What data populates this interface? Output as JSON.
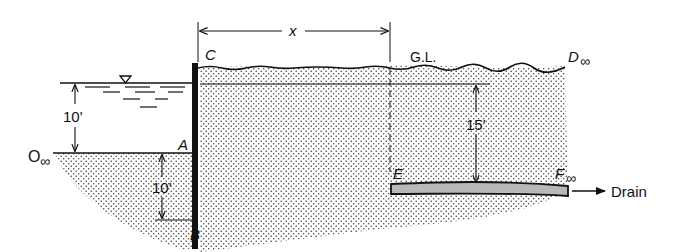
{
  "diagram": {
    "type": "sheet-pile seepage cross-section",
    "labels": {
      "point_C": "C",
      "point_A": "A",
      "point_B": "B",
      "point_D": "D",
      "point_E": "E",
      "point_F": "F",
      "point_O": "O",
      "infinity": "∞",
      "ground_level": "G.L.",
      "distance_x": "x",
      "drain": "Drain"
    },
    "dimensions": {
      "water_depth": "10'",
      "pile_embedment": "10'",
      "drain_depth": "15'"
    },
    "colors": {
      "line": "#111111",
      "soil_dots": "#333333",
      "drain_fill": "#bdbdbd",
      "background": "#ffffff"
    }
  }
}
